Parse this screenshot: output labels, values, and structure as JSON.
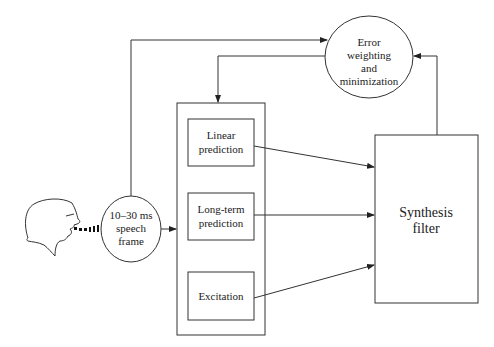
{
  "diagram": {
    "speaker": {
      "icon": "speaking-head-icon"
    },
    "speech_frame": {
      "lines": [
        "10–30 ms",
        "speech",
        "frame"
      ]
    },
    "error_node": {
      "lines": [
        "Error",
        "weighting",
        "and",
        "minimization"
      ]
    },
    "parameter_blocks": [
      {
        "lines": [
          "Linear",
          "prediction"
        ]
      },
      {
        "lines": [
          "Long-term",
          "prediction"
        ]
      },
      {
        "lines": [
          "Excitation"
        ]
      }
    ],
    "synthesis_filter": {
      "lines": [
        "Synthesis",
        "filter"
      ]
    },
    "connections": [
      {
        "from": "speech-frame",
        "to": "parameter-group"
      },
      {
        "from": "speech-frame",
        "to": "error-weighting"
      },
      {
        "from": "error-weighting",
        "to": "parameter-group"
      },
      {
        "from": "linear-prediction",
        "to": "synthesis-filter"
      },
      {
        "from": "long-term-prediction",
        "to": "synthesis-filter"
      },
      {
        "from": "excitation",
        "to": "synthesis-filter"
      },
      {
        "from": "synthesis-filter",
        "to": "error-weighting"
      }
    ]
  }
}
